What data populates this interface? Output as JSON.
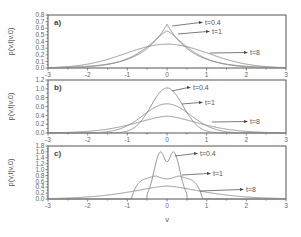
{
  "chart_data": [
    {
      "type": "line",
      "panel_label": "a)",
      "xlabel": "v",
      "ylabel": "p(v,t|v,0)",
      "xlim": [
        -3,
        3
      ],
      "ylim": [
        0,
        0.8
      ],
      "xticks": [
        -3,
        -2,
        -1,
        0,
        1,
        2,
        3
      ],
      "yticks": [
        0.0,
        0.1,
        0.2,
        0.3,
        0.4,
        0.5,
        0.6,
        0.7,
        0.8
      ],
      "ytick_labels": [
        "0.0",
        "0.1",
        "0.2",
        "0.3",
        "0.4",
        "0.5",
        "0.6",
        "0.7",
        "0.8"
      ],
      "series": [
        {
          "name": "t=0.4",
          "shape": "cusp",
          "peak": 0.66,
          "scale": 0.62
        },
        {
          "name": "t=1",
          "shape": "cusp-soft",
          "peak": 0.56,
          "scale": 0.72
        },
        {
          "name": "t=8",
          "shape": "gauss",
          "peak": 0.36,
          "scale": 1.05
        }
      ],
      "labels": [
        {
          "text": "t=0.4",
          "x": 205,
          "y": 25,
          "ax": 172,
          "ay": 26
        },
        {
          "text": "t=1",
          "x": 212,
          "y": 34,
          "ax": 178,
          "ay": 34
        },
        {
          "text": "t=8",
          "x": 250,
          "y": 55,
          "ax": 210,
          "ay": 53
        }
      ]
    },
    {
      "type": "line",
      "panel_label": "b)",
      "xlabel": "v",
      "ylabel": "p(v,t|v,0)",
      "xlim": [
        -3,
        3
      ],
      "ylim": [
        0,
        1.2
      ],
      "xticks": [
        -3,
        -2,
        -1,
        0,
        1,
        2,
        3
      ],
      "yticks": [
        0.0,
        0.2,
        0.4,
        0.6,
        0.8,
        1.0,
        1.2
      ],
      "ytick_labels": [
        "0.0",
        "0.2",
        "0.4",
        "0.6",
        "0.8",
        "1.0",
        "1.2"
      ],
      "series": [
        {
          "name": "t=0.4",
          "shape": "gauss",
          "peak": 1.02,
          "scale": 0.4
        },
        {
          "name": "t=1",
          "shape": "gauss",
          "peak": 0.66,
          "scale": 0.6
        },
        {
          "name": "t=8",
          "shape": "gauss-wide",
          "peak": 0.38,
          "scale": 1.0
        }
      ],
      "labels": [
        {
          "text": "t=0.4",
          "x": 193,
          "y": 90,
          "ax": 172,
          "ay": 91
        },
        {
          "text": "t=1",
          "x": 205,
          "y": 105,
          "ax": 182,
          "ay": 104
        },
        {
          "text": "t=8",
          "x": 250,
          "y": 124,
          "ax": 212,
          "ay": 122
        }
      ]
    },
    {
      "type": "line",
      "panel_label": "c)",
      "xlabel": "v",
      "ylabel": "p(v,t|v,0)",
      "xlim": [
        -3,
        3
      ],
      "ylim": [
        0,
        1.8
      ],
      "xticks": [
        -3,
        -2,
        -1,
        0,
        1,
        2,
        3
      ],
      "yticks": [
        0.0,
        0.2,
        0.4,
        0.6,
        0.8,
        1.0,
        1.2,
        1.4,
        1.6,
        1.8
      ],
      "ytick_labels": [
        "0.0",
        "0.2",
        "0.4",
        "0.6",
        "0.8",
        "1.0",
        "1.2",
        "1.4",
        "1.6",
        "1.8"
      ],
      "series": [
        {
          "name": "t=0.4",
          "shape": "double-peak",
          "peak": 1.6,
          "dip": 1.26,
          "support": 0.5
        },
        {
          "name": "t=1",
          "shape": "plateau",
          "peak": 0.72,
          "support": 0.9
        },
        {
          "name": "t=8",
          "shape": "broad",
          "peak": 0.44,
          "scale": 1.1
        }
      ],
      "labels": [
        {
          "text": "t=0.4",
          "x": 200,
          "y": 156,
          "ax": 175,
          "ay": 156
        },
        {
          "text": "t=1",
          "x": 213,
          "y": 176,
          "ax": 182,
          "ay": 175
        },
        {
          "text": "t=8",
          "x": 246,
          "y": 192,
          "ax": 200,
          "ay": 191
        }
      ]
    }
  ],
  "axis": {
    "xlabel": "v",
    "ylabel": "p(v,t|v,0)",
    "xtick_labels": [
      "-3",
      "-2",
      "-1",
      "0",
      "1",
      "2",
      "3"
    ]
  },
  "colors": {
    "frame": "#555555",
    "curve": "#8a8a8a",
    "text": "#555555"
  }
}
